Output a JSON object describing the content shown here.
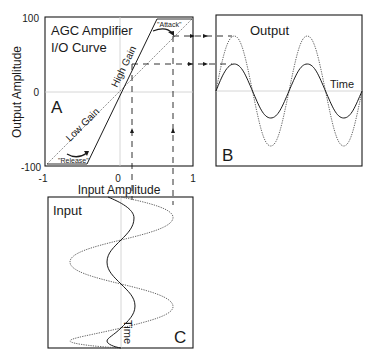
{
  "panel_a": {
    "label": "A",
    "title_line1": "AGC Amplifier",
    "title_line2": "I/O Curve",
    "y_axis_label": "Output Amplitude",
    "x_axis_label": "Input Amplitude",
    "y_ticks": [
      "100",
      "0",
      "-100"
    ],
    "x_ticks": [
      "-1",
      "0",
      "1"
    ],
    "high_gain_label": "High Gain",
    "low_gain_label": "Low Gain",
    "attack_label": "\"Attack\"",
    "release_label": "\"Release\""
  },
  "panel_b": {
    "label": "B",
    "title": "Output",
    "time_label": "Time"
  },
  "panel_c": {
    "label": "C",
    "title": "Input",
    "time_label": "Time"
  },
  "colors": {
    "ink": "#1a1a1a",
    "grid": "#bbbbbb",
    "dotted": "#666666"
  }
}
